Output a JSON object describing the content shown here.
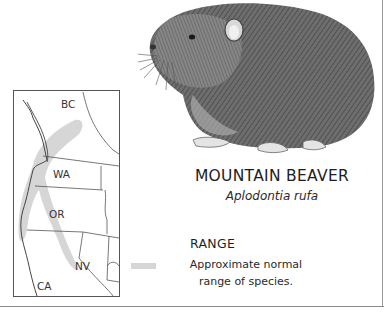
{
  "species": {
    "common_name": "MOUNTAIN BEAVER",
    "scientific_name": "Aplodontia rufa"
  },
  "range": {
    "heading": "RANGE",
    "legend_line1": "Approximate normal",
    "legend_line2": "range of species.",
    "swatch_color": "#d6d6d6"
  },
  "map": {
    "labels": [
      "BC",
      "WA",
      "OR",
      "NV",
      "CA"
    ]
  },
  "illustration": {
    "subject": "mountain beaver pencil drawing"
  }
}
